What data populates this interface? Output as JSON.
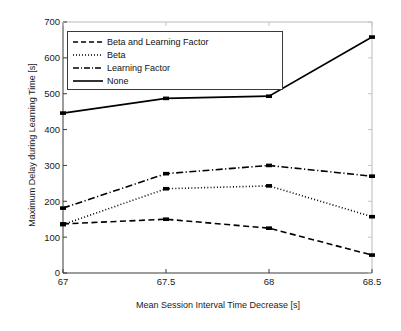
{
  "chart_data": {
    "type": "line",
    "title": "",
    "xlabel": "Mean Session Interval Time Decrease [s]",
    "ylabel": "Maximum Delay during Learning Time [s]",
    "x": [
      67,
      67.5,
      68,
      68.5
    ],
    "xticklabels": [
      "67",
      "67.5",
      "68",
      "68.5"
    ],
    "yticklabels": [
      "0",
      "100",
      "200",
      "300",
      "400",
      "500",
      "600",
      "700"
    ],
    "xlim": [
      67,
      68.5
    ],
    "ylim": [
      0,
      700
    ],
    "grid": false,
    "legend_position": "upper left",
    "series": [
      {
        "name": "Beta and Learning Factor",
        "style": "dashed",
        "color": "#000000",
        "values": [
          137,
          150,
          125,
          50
        ]
      },
      {
        "name": "Beta",
        "style": "dotted",
        "color": "#000000",
        "values": [
          135,
          235,
          243,
          157
        ]
      },
      {
        "name": "Learning Factor",
        "style": "dashdot",
        "color": "#000000",
        "values": [
          181,
          277,
          300,
          270
        ]
      },
      {
        "name": "None",
        "style": "solid",
        "color": "#000000",
        "values": [
          446,
          487,
          493,
          658
        ]
      }
    ]
  },
  "axes": {
    "y_ticks": [
      "700",
      "600",
      "500",
      "400",
      "300",
      "200",
      "100",
      "0"
    ],
    "x_ticks": [
      "67",
      "67.5",
      "68",
      "68.5"
    ],
    "y_title": "Maximum Delay during Learning Time [s]",
    "x_title": "Mean Session Interval Time Decrease [s]"
  },
  "legend": {
    "items": [
      {
        "label": "Beta and Learning Factor"
      },
      {
        "label": "Beta"
      },
      {
        "label": "Learning Factor"
      },
      {
        "label": "None"
      }
    ]
  }
}
